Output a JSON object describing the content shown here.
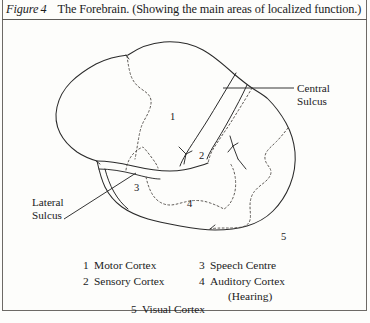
{
  "figure": {
    "label_word": "Figure",
    "number": "4",
    "caption": "The Forebrain. (Showing the main areas of localized function.)"
  },
  "diagram": {
    "callouts": [
      {
        "id": "central-sulcus",
        "line1": "Central",
        "line2": "Sulcus"
      },
      {
        "id": "lateral-sulcus",
        "line1": "Lateral",
        "line2": "Sulcus"
      }
    ],
    "region_numbers": [
      {
        "id": "region-1",
        "text": "1",
        "x": 170,
        "y": 92
      },
      {
        "id": "region-2",
        "text": "2",
        "x": 199,
        "y": 131
      },
      {
        "id": "region-3",
        "text": "3",
        "x": 134,
        "y": 163
      },
      {
        "id": "region-4",
        "text": "4",
        "x": 187,
        "y": 179
      },
      {
        "id": "region-5",
        "text": "5",
        "x": 281,
        "y": 212
      }
    ]
  },
  "legend": {
    "column_left": [
      {
        "num": "1",
        "label": "Motor Cortex"
      },
      {
        "num": "2",
        "label": "Sensory Cortex"
      }
    ],
    "column_right": [
      {
        "num": "3",
        "label": "Speech Centre"
      },
      {
        "num": "4",
        "label": "Auditory Cortex"
      }
    ],
    "sub_note": "(Hearing)",
    "last_row": {
      "num": "5",
      "label": "Visual Cortex"
    }
  },
  "colors": {
    "ink": "#1b1b1b",
    "rule": "#6d6a66",
    "paper": "#fdfdfb",
    "outline": "#2a2a2a",
    "dotted": "#55514d"
  }
}
